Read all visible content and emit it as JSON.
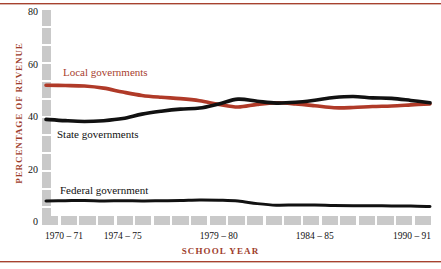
{
  "chart_data": {
    "type": "line",
    "title": "",
    "xlabel": "SCHOOL YEAR",
    "ylabel": "PERCENTAGE OF REVENUE",
    "ylim": [
      0,
      80
    ],
    "yticks": [
      0,
      20,
      40,
      60,
      80
    ],
    "grid": false,
    "legend_position": "inline-annotations",
    "x": [
      "1970-71",
      "1971-72",
      "1972-73",
      "1973-74",
      "1974-75",
      "1975-76",
      "1976-77",
      "1977-78",
      "1978-79",
      "1979-80",
      "1980-81",
      "1981-82",
      "1982-83",
      "1983-84",
      "1984-85",
      "1985-86",
      "1986-87",
      "1987-88",
      "1988-89",
      "1989-90",
      "1990-91"
    ],
    "xtick_labels": [
      "1970 – 71",
      "1974 – 75",
      "1979 – 80",
      "1984 – 85",
      "1990 – 91"
    ],
    "xtick_index": [
      0,
      4,
      9,
      14,
      20
    ],
    "series": [
      {
        "name": "Local governments",
        "color": "#b03a28",
        "width": 3.6,
        "values": [
          52.1,
          52.0,
          51.8,
          51.0,
          49.5,
          48.2,
          47.5,
          47.0,
          46.2,
          44.8,
          43.8,
          44.8,
          45.4,
          45.0,
          44.3,
          43.5,
          43.6,
          44.0,
          44.2,
          44.6,
          45.0
        ]
      },
      {
        "name": "State governments",
        "color": "#111111",
        "width": 3.6,
        "values": [
          39.1,
          38.6,
          38.3,
          38.6,
          39.4,
          41.1,
          42.2,
          43.0,
          43.4,
          45.0,
          46.8,
          46.0,
          45.3,
          45.6,
          46.4,
          47.4,
          47.8,
          47.3,
          47.1,
          46.3,
          45.4
        ]
      },
      {
        "name": "Federal government",
        "color": "#111111",
        "width": 3.0,
        "values": [
          8.0,
          8.1,
          8.2,
          8.0,
          8.1,
          8.0,
          8.1,
          8.2,
          8.4,
          8.3,
          8.0,
          7.0,
          6.4,
          6.5,
          6.5,
          6.3,
          6.2,
          6.2,
          6.1,
          6.1,
          5.9
        ]
      }
    ]
  },
  "annotations": {
    "local": "Local governments",
    "state": "State governments",
    "federal": "Federal government"
  },
  "colors": {
    "accent": "#a8412f",
    "local": "#b03a28",
    "state": "#111111",
    "federal": "#111111",
    "axis_bar": "#c9c9c9"
  }
}
